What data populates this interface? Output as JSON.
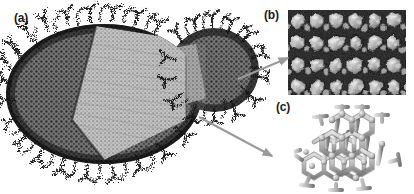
{
  "figure": {
    "background_color": "#ffffff",
    "width_px": 414,
    "height_px": 194
  },
  "panels": [
    {
      "key": "a",
      "label": "(a)",
      "name": "nanoparticle-molecular-model",
      "description": "All-atom molecular model of an ellipsoidal nanoparticle with dense surface ligand corona and a lighter wedge-shaped cut-away revealing the ordered interior, plus a smaller attached lobe at the right",
      "colors": {
        "ligand_dark": "#1c1c1c",
        "core_mid": "#6b6b6b",
        "cutaway_light": "#b4b4b4"
      }
    },
    {
      "key": "b",
      "label": "(b)",
      "name": "micrograph-cellular-texture",
      "description": "Grayscale electron micrograph showing a polygonal cellular / honeycomb surface texture with dark grain boundaries and light faceted grains",
      "colors": {
        "boundary": "#101010",
        "grain_light": "#d8d8d8",
        "grain_mid": "#8a8a8a"
      }
    },
    {
      "key": "c",
      "label": "(c)",
      "name": "hexagonal-lattice-structure",
      "description": "Three-dimensional ball-and-stick hexagonal crystal lattice fragment rendered in light gray with shaded bonds",
      "colors": {
        "bond_light": "#c9c9c9",
        "bond_shade": "#8e8e8e",
        "bond_edge": "#3a3a3a"
      }
    }
  ],
  "annotations": {
    "arrow_color": "#9a9a9a",
    "arrows": [
      {
        "name": "arrow-to-panel-b",
        "from_label": "nanoparticle surface",
        "to_label": "(b) micrograph"
      },
      {
        "name": "arrow-to-panel-c",
        "from_label": "nanoparticle interior",
        "to_label": "(c) lattice"
      }
    ]
  }
}
